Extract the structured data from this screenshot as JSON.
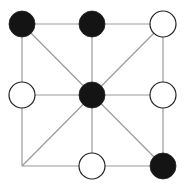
{
  "diagram": {
    "type": "board-game-position",
    "colors": {
      "background": "#ffffff",
      "line": "#9a9a9a",
      "black_piece": "#141414",
      "white_piece": "#ffffff",
      "piece_outline": "#222222"
    },
    "grid": {
      "x": [
        22,
        92,
        163
      ],
      "y": [
        24,
        95,
        166
      ],
      "piece_radius": 13
    },
    "lines": [
      {
        "from": [
          0,
          0
        ],
        "to": [
          2,
          0
        ]
      },
      {
        "from": [
          0,
          1
        ],
        "to": [
          2,
          1
        ]
      },
      {
        "from": [
          0,
          2
        ],
        "to": [
          2,
          2
        ]
      },
      {
        "from": [
          0,
          0
        ],
        "to": [
          0,
          2
        ]
      },
      {
        "from": [
          1,
          0
        ],
        "to": [
          1,
          2
        ]
      },
      {
        "from": [
          2,
          0
        ],
        "to": [
          2,
          2
        ]
      },
      {
        "from": [
          0,
          0
        ],
        "to": [
          2,
          2
        ]
      },
      {
        "from": [
          2,
          0
        ],
        "to": [
          0,
          2
        ]
      }
    ],
    "pieces": [
      {
        "col": 0,
        "row": 0,
        "color": "black"
      },
      {
        "col": 1,
        "row": 0,
        "color": "black"
      },
      {
        "col": 2,
        "row": 0,
        "color": "white"
      },
      {
        "col": 0,
        "row": 1,
        "color": "white"
      },
      {
        "col": 1,
        "row": 1,
        "color": "black"
      },
      {
        "col": 2,
        "row": 1,
        "color": "white"
      },
      {
        "col": 1,
        "row": 2,
        "color": "white"
      },
      {
        "col": 2,
        "row": 2,
        "color": "black"
      }
    ],
    "empty_points": [
      {
        "col": 0,
        "row": 2
      }
    ]
  }
}
